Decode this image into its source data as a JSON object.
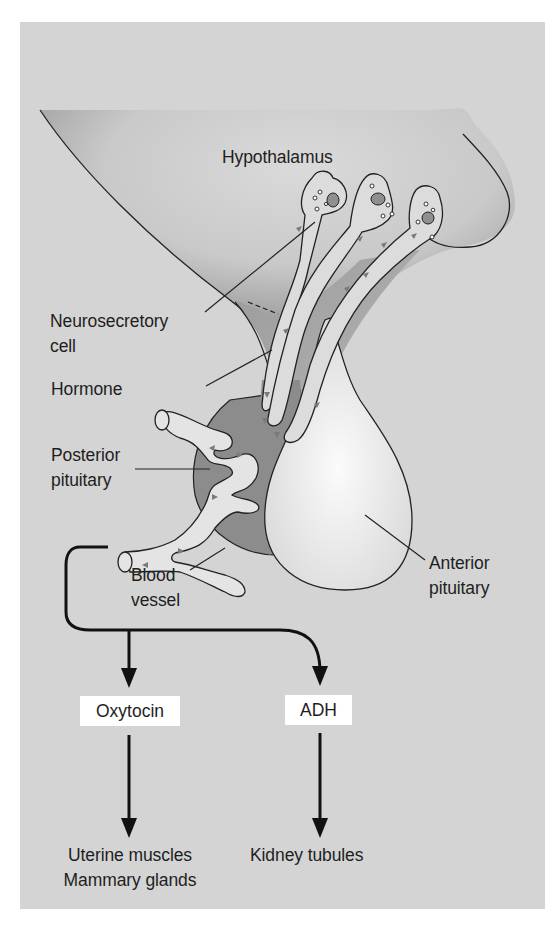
{
  "figure": {
    "background_color": "#d4d4d4",
    "structure_dark_color": "#8a8a8a",
    "vessel_color": "#e6e6e6",
    "arrow_color": "#111111"
  },
  "labels": {
    "hypothalamus": "Hypothalamus",
    "neurosecretory_cell": "Neurosecretory\ncell",
    "hormone": "Hormone",
    "posterior_pituitary": "Posterior\npituitary",
    "blood_vessel": "Blood\nvessel",
    "anterior_pituitary": "Anterior\npituitary"
  },
  "hormones": [
    {
      "name": "Oxytocin",
      "targets": "Uterine muscles\nMammary glands"
    },
    {
      "name": "ADH",
      "targets": "Kidney tubules"
    }
  ]
}
